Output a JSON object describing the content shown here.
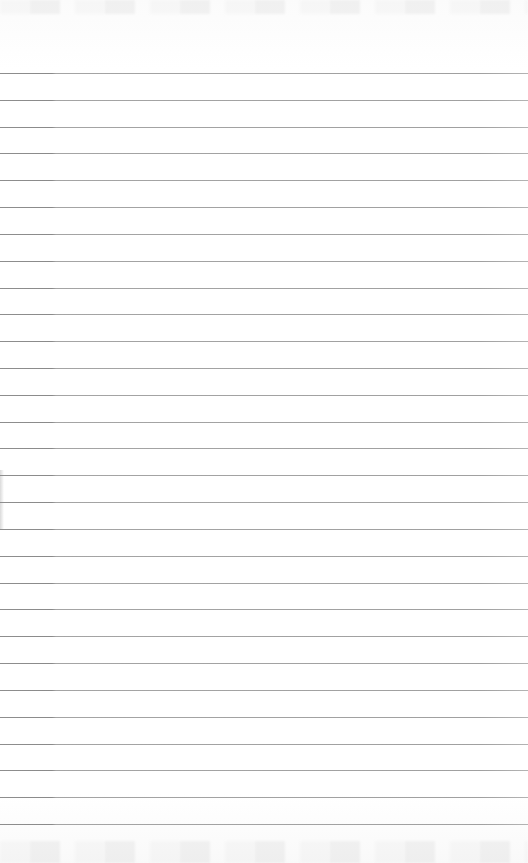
{
  "sheet": {
    "type": "lined paper",
    "background_color": "#ffffff",
    "line_color": "#a0a0a0",
    "line_count": 29,
    "first_line_y": 73,
    "line_spacing": 26.82,
    "text": ""
  }
}
